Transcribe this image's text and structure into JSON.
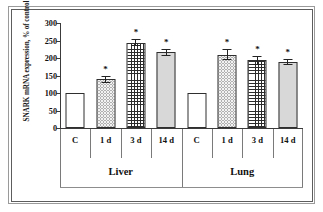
{
  "chart_data": {
    "type": "bar",
    "title": "",
    "xlabel": "",
    "ylabel": "SNARK mRNA expression, % of control",
    "ylim": [
      0,
      300
    ],
    "ytick_step": 50,
    "yticks": [
      300,
      250,
      200,
      150,
      100,
      50,
      0
    ],
    "grid": false,
    "legend": "none",
    "categories": [
      "C",
      "1 d",
      "3 d",
      "14 d",
      "C",
      "1 d",
      "3 d",
      "14 d"
    ],
    "groups": [
      {
        "name": "Liver",
        "categories": [
          "C",
          "1 d",
          "3 d",
          "14 d"
        ]
      },
      {
        "name": "Lung",
        "categories": [
          "C",
          "1 d",
          "3 d",
          "14 d"
        ]
      }
    ],
    "bars": [
      {
        "group": "Liver",
        "category": "C",
        "value": 100,
        "error": 0,
        "significant": false,
        "pattern": "open"
      },
      {
        "group": "Liver",
        "category": "1 d",
        "value": 139,
        "error": 9,
        "significant": true,
        "pattern": "dots"
      },
      {
        "group": "Liver",
        "category": "3 d",
        "value": 243,
        "error": 10,
        "significant": true,
        "pattern": "grid"
      },
      {
        "group": "Liver",
        "category": "14 d",
        "value": 217,
        "error": 10,
        "significant": true,
        "pattern": "solid"
      },
      {
        "group": "Lung",
        "category": "C",
        "value": 100,
        "error": 0,
        "significant": false,
        "pattern": "open"
      },
      {
        "group": "Lung",
        "category": "1 d",
        "value": 210,
        "error": 16,
        "significant": true,
        "pattern": "dots"
      },
      {
        "group": "Lung",
        "category": "3 d",
        "value": 193,
        "error": 12,
        "significant": true,
        "pattern": "grid"
      },
      {
        "group": "Lung",
        "category": "14 d",
        "value": 189,
        "error": 9,
        "significant": true,
        "pattern": "solid"
      }
    ],
    "significance_marker": "*",
    "annotations": []
  }
}
